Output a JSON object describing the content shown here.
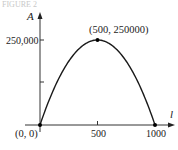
{
  "figure": {
    "caption_partial": "FIGURE 2"
  },
  "chart_data": {
    "type": "line",
    "title": "",
    "xlabel": "l",
    "ylabel": "A",
    "function": "A = l(1000 - l)",
    "x": [
      0,
      100,
      200,
      300,
      400,
      500,
      600,
      700,
      800,
      900,
      1000
    ],
    "y": [
      0,
      90000,
      160000,
      210000,
      240000,
      250000,
      240000,
      210000,
      160000,
      90000,
      0
    ],
    "xlim": [
      0,
      1000
    ],
    "ylim": [
      0,
      250000
    ],
    "x_ticks": [
      500,
      1000
    ],
    "x_tick_labels": [
      "500",
      "1000"
    ],
    "y_ticks": [
      125000,
      250000
    ],
    "y_tick_labels": [
      "",
      "250,000"
    ],
    "grid": false,
    "legend": null,
    "annotations": [
      {
        "label": "(0, 0)",
        "x": 0,
        "y": 0
      },
      {
        "label": "(500, 250000)",
        "x": 500,
        "y": 250000
      },
      {
        "label": "",
        "x": 1000,
        "y": 0
      }
    ],
    "colors": {
      "curve": "#1a1a1a",
      "axes": "#333333",
      "points": "#000000"
    }
  }
}
